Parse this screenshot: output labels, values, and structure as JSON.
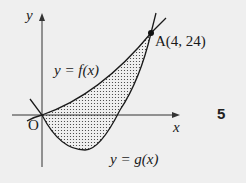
{
  "labels": {
    "y_axis": "y",
    "x_axis": "x",
    "origin": "O",
    "f_curve": "y = f(x)",
    "g_curve": "y = g(x)",
    "point_a": "A(4, 24)",
    "question_number": "5"
  },
  "figure": {
    "point_a": {
      "x": 4,
      "y": 24
    },
    "shaded_region": "between f(x) and g(x) from x = 0 to x = 4",
    "colors": {
      "background": "#efefef",
      "stroke": "#1a1a1a",
      "shading_dots": "#333333"
    }
  }
}
